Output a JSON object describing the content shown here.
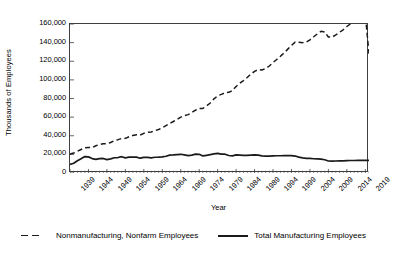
{
  "chart_data": {
    "type": "line",
    "title": "",
    "xlabel": "Year",
    "ylabel": "Thousands of Employees",
    "xlim": [
      1939,
      2020
    ],
    "ylim": [
      0,
      160000
    ],
    "grid": false,
    "legend_position": "bottom",
    "y_ticks": [
      0,
      20000,
      40000,
      60000,
      80000,
      100000,
      120000,
      140000,
      160000
    ],
    "y_tick_labels": [
      "0",
      "20,000",
      "40,000",
      "60,000",
      "80,000",
      "100,000",
      "120,000",
      "140,000",
      "160,000"
    ],
    "x_tick_labels": [
      "1939",
      "1944",
      "1949",
      "1954",
      "1959",
      "1964",
      "1969",
      "1974",
      "1979",
      "1984",
      "1989",
      "1994",
      "1999",
      "2004",
      "2009",
      "2014",
      "2019"
    ],
    "x": [
      1939,
      1940,
      1941,
      1942,
      1943,
      1944,
      1945,
      1946,
      1947,
      1948,
      1949,
      1950,
      1951,
      1952,
      1953,
      1954,
      1955,
      1956,
      1957,
      1958,
      1959,
      1960,
      1961,
      1962,
      1963,
      1964,
      1965,
      1966,
      1967,
      1968,
      1969,
      1970,
      1971,
      1972,
      1973,
      1974,
      1975,
      1976,
      1977,
      1978,
      1979,
      1980,
      1981,
      1982,
      1983,
      1984,
      1985,
      1986,
      1987,
      1988,
      1989,
      1990,
      1991,
      1992,
      1993,
      1994,
      1995,
      1996,
      1997,
      1998,
      1999,
      2000,
      2001,
      2002,
      2003,
      2004,
      2005,
      2006,
      2007,
      2008,
      2009,
      2010,
      2011,
      2012,
      2013,
      2014,
      2015,
      2016,
      2017,
      2018,
      2019,
      2020
    ],
    "series": [
      {
        "name": "Nonmanufacturing, Nonfarm Employees",
        "style": "dashed",
        "color": "#1a1a1a",
        "values": [
          20300,
          21400,
          23300,
          25200,
          27000,
          27400,
          27300,
          29300,
          30500,
          31400,
          31300,
          32700,
          34600,
          35800,
          37100,
          37200,
          38900,
          40300,
          41000,
          40800,
          42600,
          43700,
          44100,
          45500,
          46700,
          48600,
          50800,
          53100,
          55300,
          57600,
          60000,
          61600,
          62700,
          64900,
          67400,
          69300,
          69300,
          72000,
          75200,
          79600,
          82900,
          84400,
          86200,
          86600,
          88400,
          92900,
          96300,
          99200,
          102600,
          106200,
          109200,
          111100,
          110600,
          112200,
          114900,
          118600,
          121900,
          125300,
          129000,
          133000,
          137000,
          140600,
          140300,
          140000,
          140500,
          143000,
          146300,
          149400,
          152100,
          151500,
          146000,
          145900,
          148300,
          151000,
          153800,
          157300,
          160200,
          163100,
          165700,
          168400,
          170200,
          128000
        ]
      },
      {
        "name": "Total Manufacturing Employees",
        "style": "solid",
        "color": "#1a1a1a",
        "values": [
          9200,
          10400,
          13100,
          15300,
          17600,
          17300,
          15500,
          14700,
          15500,
          15600,
          14400,
          15200,
          16400,
          16600,
          17500,
          16300,
          17000,
          17200,
          17100,
          15900,
          16700,
          16800,
          16300,
          16900,
          17000,
          17300,
          18000,
          19200,
          19400,
          19800,
          20100,
          19400,
          18600,
          19200,
          20200,
          20100,
          18300,
          19000,
          19700,
          20500,
          21000,
          20300,
          20200,
          18800,
          18400,
          19400,
          19200,
          19000,
          18900,
          19300,
          19400,
          19100,
          18400,
          18100,
          18100,
          18300,
          18500,
          18500,
          18700,
          18800,
          18600,
          18200,
          17100,
          16300,
          15800,
          15600,
          15300,
          15200,
          14900,
          14200,
          12900,
          12700,
          12900,
          13000,
          13100,
          13300,
          13400,
          13400,
          13500,
          13600,
          13700,
          13500
        ]
      }
    ]
  },
  "axes": {
    "y_title": "Thousands of Employees",
    "x_title": "Year"
  },
  "legend": {
    "entries": [
      {
        "label": "Nonmanufacturing, Nonfarm Employees",
        "style": "dashed"
      },
      {
        "label": "Total Manufacturing Employees",
        "style": "solid"
      }
    ]
  },
  "colors": {
    "line": "#1a1a1a",
    "axis": "#3f3f3f",
    "text": "#000000",
    "background": "#ffffff"
  }
}
